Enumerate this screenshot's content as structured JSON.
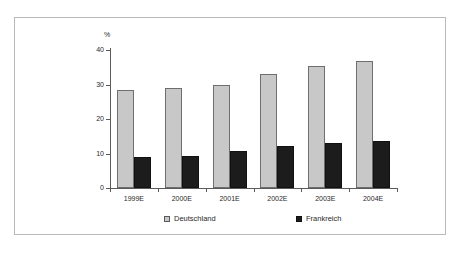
{
  "chart_data": {
    "type": "bar",
    "title": "",
    "subtitle": "",
    "xlabel": "",
    "ylabel": "%",
    "ylim": [
      0,
      40
    ],
    "yticks": [
      0,
      10,
      20,
      30,
      40
    ],
    "grid": false,
    "legend_position": "bottom",
    "categories": [
      "1999E",
      "2000E",
      "2001E",
      "2002E",
      "2003E",
      "2004E"
    ],
    "series": [
      {
        "name": "Deutschland",
        "color": "#c8c8c8",
        "values": [
          28.4,
          29.0,
          29.9,
          33.0,
          35.5,
          36.8
        ]
      },
      {
        "name": "Frankreich",
        "color": "#1c1c1c",
        "values": [
          9.0,
          9.4,
          10.6,
          12.2,
          12.9,
          13.7
        ]
      }
    ]
  }
}
